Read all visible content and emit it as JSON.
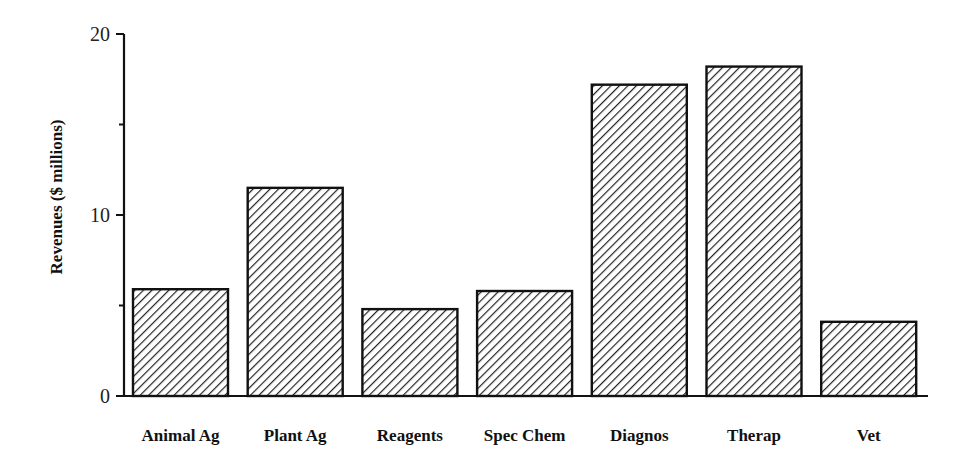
{
  "chart_data": {
    "type": "bar",
    "title": "",
    "xlabel": "",
    "ylabel": "Revenues ($ millions)",
    "ylim": [
      0,
      20
    ],
    "yticks": [
      0,
      10,
      20
    ],
    "yminor_ticks": [
      5,
      15
    ],
    "grid": false,
    "legend": null,
    "bar_fill": "diagonal hatch",
    "categories": [
      "Animal Ag",
      "Plant Ag",
      "Reagents",
      "Spec Chem",
      "Diagnos",
      "Therap",
      "Vet"
    ],
    "values": [
      5.9,
      11.5,
      4.8,
      5.8,
      17.2,
      18.2,
      4.1
    ]
  },
  "colors": {
    "stroke": "#111111",
    "hatch": "#222222",
    "background": "#ffffff"
  }
}
